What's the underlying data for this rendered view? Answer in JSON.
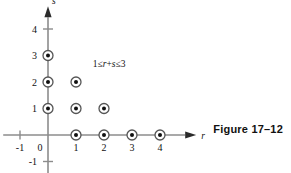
{
  "figure": {
    "caption": "Figure 17–12",
    "annotation": {
      "full": "1≤r+s≤3",
      "lower_bound": "1",
      "left_rel": "≤",
      "expr_r": "r",
      "plus": "+",
      "expr_s": "s",
      "right_rel": "≤",
      "upper_bound": "3"
    }
  },
  "chart_data": {
    "type": "scatter",
    "title": "",
    "subtitle": "",
    "xlabel": "r",
    "ylabel": "s",
    "xlim": [
      -1.6,
      5.4
    ],
    "ylim": [
      -1.6,
      4.9
    ],
    "grid": false,
    "legend": null,
    "x_ticks": [
      -1,
      0,
      1,
      2,
      3,
      4
    ],
    "x_tick_labels": [
      "-1",
      "0",
      "1",
      "2",
      "3",
      "4"
    ],
    "y_ticks": [
      -1,
      1,
      2,
      3,
      4
    ],
    "y_tick_labels": [
      "-1",
      "1",
      "2",
      "3",
      "4"
    ],
    "marker": "circle-with-center-dot",
    "points": [
      {
        "r": 0,
        "s": 1
      },
      {
        "r": 0,
        "s": 2
      },
      {
        "r": 0,
        "s": 3
      },
      {
        "r": 1,
        "s": 0
      },
      {
        "r": 1,
        "s": 1
      },
      {
        "r": 1,
        "s": 2
      },
      {
        "r": 2,
        "s": 0
      },
      {
        "r": 2,
        "s": 1
      },
      {
        "r": 3,
        "s": 0
      },
      {
        "r": 4,
        "s": 0
      }
    ],
    "annotations": [
      {
        "text": "1≤r+s≤3",
        "x": 1.6,
        "y": 2.55
      }
    ],
    "colors": {
      "axis": "#8c8c8c",
      "marker_ring": "#555555",
      "marker_core": "#111111",
      "text": "#111111",
      "background": "#ffffff"
    }
  },
  "axes": {
    "x_axis_name": "r",
    "y_axis_name": "s",
    "arrow_x": "right-arrow",
    "arrow_y": "up-arrow"
  }
}
